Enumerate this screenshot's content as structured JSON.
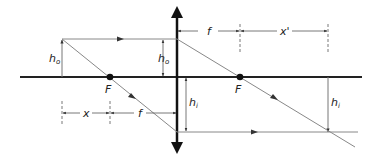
{
  "diagram": {
    "labels": {
      "object_height": "h",
      "object_height_sub": "o",
      "image_height": "h",
      "image_height_sub": "i",
      "focal_left": "F",
      "focal_right": "F",
      "focal_length": "f",
      "object_distance": "x",
      "image_distance": "x'"
    },
    "colors": {
      "axis": "#222222",
      "lens": "#111111",
      "ray": "#888888",
      "dim": "#555555"
    }
  }
}
